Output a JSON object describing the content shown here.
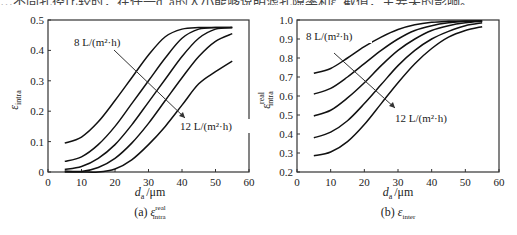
{
  "header": {
    "partial_text": "…不同孔径比较时，在任一d_a的大小能够说明滤孔隙率和ε_截值，主要关的影响。"
  },
  "chart_data": [
    {
      "type": "line",
      "panel": "a",
      "caption": "(a) ε_intra^real",
      "caption_prefix": "(a)",
      "caption_symbol": "ε",
      "caption_sup": "real",
      "caption_sub": "intra",
      "xlabel": "d_a /μm",
      "xlabel_var": "d",
      "xlabel_sub": "a",
      "xlabel_unit": "/μm",
      "ylabel": "ε_intra",
      "ylabel_symbol": "ε",
      "ylabel_sub": "intra",
      "ylabel_sup": "",
      "xlim": [
        0,
        60
      ],
      "ylim": [
        0,
        0.5
      ],
      "xticks": [
        "0",
        "10",
        "20",
        "30",
        "40",
        "50",
        "60"
      ],
      "yticks": [
        "0",
        "0.1",
        "0.2",
        "0.3",
        "0.4",
        "0.5"
      ],
      "annotation_start": "8 L/(m²·h)",
      "annotation_end": "12 L/(m²·h)",
      "x": [
        5,
        10,
        15,
        20,
        25,
        30,
        35,
        40,
        45,
        50,
        55
      ],
      "series": [
        {
          "name": "8 L/(m²·h)",
          "values": [
            0.095,
            0.115,
            0.165,
            0.235,
            0.31,
            0.385,
            0.445,
            0.47,
            0.475,
            0.475,
            0.475
          ]
        },
        {
          "name": "9 L/(m²·h)",
          "values": [
            0.035,
            0.05,
            0.09,
            0.15,
            0.225,
            0.3,
            0.375,
            0.44,
            0.47,
            0.475,
            0.475
          ]
        },
        {
          "name": "10 L/(m²·h)",
          "values": [
            0.008,
            0.018,
            0.045,
            0.09,
            0.155,
            0.23,
            0.305,
            0.38,
            0.44,
            0.47,
            0.475
          ]
        },
        {
          "name": "11 L/(m²·h)",
          "values": [
            0.003,
            0.002,
            0.015,
            0.045,
            0.095,
            0.16,
            0.235,
            0.31,
            0.38,
            0.43,
            0.455
          ]
        },
        {
          "name": "12 L/(m²·h)",
          "values": [
            0.0,
            0.0,
            0.0,
            0.01,
            0.04,
            0.09,
            0.15,
            0.22,
            0.29,
            0.33,
            0.365
          ]
        }
      ]
    },
    {
      "type": "line",
      "panel": "b",
      "caption": "(b) ε_inter",
      "caption_prefix": "(b)",
      "caption_symbol": "ε",
      "caption_sup": "",
      "caption_sub": "inter",
      "xlabel": "d_a /μm",
      "xlabel_var": "d",
      "xlabel_sub": "a",
      "xlabel_unit": "/μm",
      "ylabel": "ε_intra^real",
      "ylabel_symbol": "ε",
      "ylabel_sub": "intra",
      "ylabel_sup": "real",
      "xlim": [
        0,
        60
      ],
      "ylim": [
        0.2,
        1.0
      ],
      "xticks": [
        "0",
        "10",
        "20",
        "30",
        "40",
        "50",
        "60"
      ],
      "yticks": [
        "0.2",
        "0.3",
        "0.4",
        "0.5",
        "0.6",
        "0.7",
        "0.8",
        "0.9",
        "1.0"
      ],
      "annotation_start": "8 L/(m²·h)",
      "annotation_end": "12 L/(m²·h)",
      "x": [
        5,
        10,
        15,
        20,
        25,
        30,
        35,
        40,
        45,
        50,
        55
      ],
      "series": [
        {
          "name": "8 L/(m²·h)",
          "values": [
            0.72,
            0.745,
            0.8,
            0.86,
            0.91,
            0.95,
            0.975,
            0.988,
            0.993,
            0.995,
            0.995
          ]
        },
        {
          "name": "9 L/(m²·h)",
          "values": [
            0.61,
            0.64,
            0.7,
            0.77,
            0.84,
            0.9,
            0.945,
            0.97,
            0.985,
            0.993,
            0.995
          ]
        },
        {
          "name": "10 L/(m²·h)",
          "values": [
            0.495,
            0.525,
            0.59,
            0.67,
            0.76,
            0.84,
            0.9,
            0.945,
            0.97,
            0.985,
            0.993
          ]
        },
        {
          "name": "11 L/(m²·h)",
          "values": [
            0.38,
            0.41,
            0.47,
            0.56,
            0.66,
            0.76,
            0.84,
            0.9,
            0.94,
            0.97,
            0.985
          ]
        },
        {
          "name": "12 L/(m²·h)",
          "values": [
            0.285,
            0.305,
            0.36,
            0.45,
            0.56,
            0.67,
            0.77,
            0.85,
            0.91,
            0.945,
            0.965
          ]
        }
      ]
    }
  ]
}
